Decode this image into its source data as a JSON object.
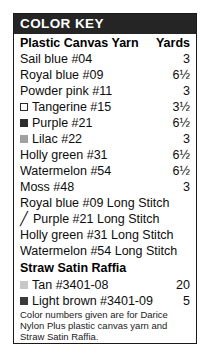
{
  "key": {
    "header_title": "COLOR KEY",
    "columns": {
      "name": "Plastic Canvas Yarn",
      "yards": "Yards"
    },
    "yarn_rows": [
      {
        "swatch": "none",
        "color": "",
        "label": "Sail blue #04",
        "yards": "3"
      },
      {
        "swatch": "none",
        "color": "",
        "label": "Royal blue #09",
        "yards": "6½"
      },
      {
        "swatch": "none",
        "color": "",
        "label": "Powder pink #11",
        "yards": "3"
      },
      {
        "swatch": "open",
        "color": "#ffffff",
        "label": "Tangerine #15",
        "yards": "3½"
      },
      {
        "swatch": "solid",
        "color": "#2d2d2d",
        "label": "Purple #21",
        "yards": "6½"
      },
      {
        "swatch": "solid",
        "color": "#a0a0a0",
        "label": "Lilac #22",
        "yards": "3"
      },
      {
        "swatch": "none",
        "color": "",
        "label": "Holly green #31",
        "yards": "6½"
      },
      {
        "swatch": "none",
        "color": "",
        "label": "Watermelon #54",
        "yards": "6½"
      },
      {
        "swatch": "none",
        "color": "",
        "label": "Moss #48",
        "yards": "3"
      }
    ],
    "long_stitch_rows": [
      {
        "marker": "none",
        "label": "Royal blue #09 Long Stitch",
        "yards": ""
      },
      {
        "marker": "slash",
        "symbol": "╱",
        "label": "Purple #21 Long Stitch",
        "yards": ""
      },
      {
        "marker": "none",
        "label": "Holly green #31 Long Stitch",
        "yards": ""
      },
      {
        "marker": "none",
        "label": "Watermelon #54 Long Stitch",
        "yards": ""
      }
    ],
    "raffia_heading": "Straw Satin Raffia",
    "raffia_rows": [
      {
        "swatch": "solid",
        "color": "#c8c8c8",
        "label": "Tan #3401-08",
        "yards": "20"
      },
      {
        "swatch": "solid",
        "color": "#3a3a3a",
        "label": "Light brown #3401-09",
        "yards": "5"
      }
    ],
    "footnote": "Color numbers given are for Darice Nylon Plus plastic canvas yarn and Straw Satin Raffia."
  },
  "colors": {
    "header_bar": "#252525",
    "border": "#1a1a1a",
    "text": "#0d0d0d",
    "page_bg": "#ffffff"
  }
}
